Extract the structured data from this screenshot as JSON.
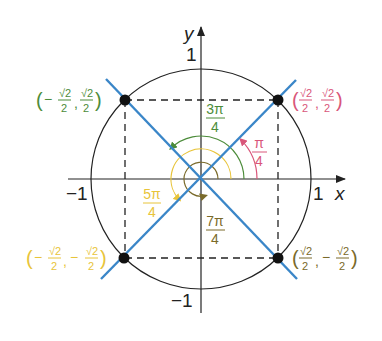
{
  "diagram": {
    "axes": {
      "x_label": "x",
      "y_label": "y",
      "x_pos_tick": "1",
      "x_neg_tick": "−1",
      "y_pos_tick": "1",
      "y_neg_tick": "−1"
    },
    "colors": {
      "axis": "#222222",
      "circle": "#222222",
      "lines": "#3a86c8",
      "point": "#111111",
      "pi_over_4": "#d9567a",
      "three_pi_over_4": "#4c8c3a",
      "five_pi_over_4": "#e8c43a",
      "seven_pi_over_4": "#7a6a2a"
    },
    "angles": [
      {
        "id": "pi_over_4",
        "num": "π",
        "den": "4",
        "color": "#d9567a"
      },
      {
        "id": "three_pi_over_4",
        "num": "3π",
        "den": "4",
        "color": "#4c8c3a"
      },
      {
        "id": "five_pi_over_4",
        "num": "5π",
        "den": "4",
        "color": "#e8c43a"
      },
      {
        "id": "seven_pi_over_4",
        "num": "7π",
        "den": "4",
        "color": "#7a6a2a"
      }
    ],
    "points": [
      {
        "id": "q1",
        "x_sign": "",
        "y_sign": "",
        "x_num": "√2",
        "x_den": "2",
        "y_num": "√2",
        "y_den": "2",
        "color": "#d9567a"
      },
      {
        "id": "q2",
        "x_sign": "−",
        "y_sign": "",
        "x_num": "√2",
        "x_den": "2",
        "y_num": "√2",
        "y_den": "2",
        "color": "#4c8c3a"
      },
      {
        "id": "q3",
        "x_sign": "−",
        "y_sign": "−",
        "x_num": "√2",
        "x_den": "2",
        "y_num": "√2",
        "y_den": "2",
        "color": "#e8c43a"
      },
      {
        "id": "q4",
        "x_sign": "",
        "y_sign": "−",
        "x_num": "√2",
        "x_den": "2",
        "y_num": "√2",
        "y_den": "2",
        "color": "#7a6a2a"
      }
    ],
    "paren_open": "(",
    "paren_close": ")",
    "comma": ","
  }
}
